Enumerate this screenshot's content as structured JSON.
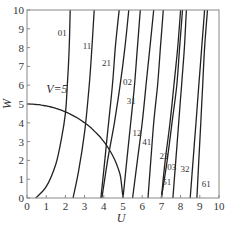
{
  "chart_data": {
    "type": "line",
    "title": "",
    "xlabel": "U",
    "ylabel": "W",
    "xlim": [
      0,
      10
    ],
    "ylim": [
      0,
      10
    ],
    "xticks": [
      "0",
      "1",
      "2",
      "3",
      "4",
      "5",
      "6",
      "7",
      "8",
      "9",
      "10"
    ],
    "yticks": [
      "0",
      "1",
      "2",
      "3",
      "4",
      "5",
      "6",
      "7",
      "8",
      "9",
      "10"
    ],
    "grid": false,
    "legend": null,
    "annotations": [
      {
        "text": "V=5",
        "x": 1.0,
        "y": 5.6
      }
    ],
    "series": [
      {
        "name": "V=5",
        "points": [
          [
            0,
            5
          ],
          [
            1,
            4.9
          ],
          [
            2,
            4.58
          ],
          [
            3,
            4.0
          ],
          [
            3.5,
            3.57
          ],
          [
            4,
            3.0
          ],
          [
            4.5,
            2.18
          ],
          [
            4.8,
            1.4
          ],
          [
            5,
            0
          ]
        ]
      },
      {
        "name": "01",
        "label_pos": [
          1.6,
          8.6
        ],
        "points": [
          [
            0.45,
            0
          ],
          [
            1.0,
            0.6
          ],
          [
            1.5,
            1.8
          ],
          [
            1.8,
            3.2
          ],
          [
            2.0,
            4.5
          ],
          [
            2.1,
            6
          ],
          [
            2.2,
            8
          ],
          [
            2.25,
            10
          ]
        ]
      },
      {
        "name": "11",
        "label_pos": [
          2.9,
          7.9
        ],
        "points": [
          [
            2.4,
            0
          ],
          [
            2.7,
            1.5
          ],
          [
            3.0,
            3.5
          ],
          [
            3.2,
            5.5
          ],
          [
            3.35,
            7.5
          ],
          [
            3.5,
            10
          ]
        ]
      },
      {
        "name": "21",
        "label_pos": [
          3.9,
          7.0
        ],
        "points": [
          [
            3.85,
            0
          ],
          [
            4.05,
            2
          ],
          [
            4.25,
            4
          ],
          [
            4.45,
            6
          ],
          [
            4.6,
            8
          ],
          [
            4.8,
            10
          ]
        ]
      },
      {
        "name": "02",
        "label_pos": [
          5.0,
          6.0
        ],
        "points": [
          [
            3.9,
            0
          ],
          [
            4.2,
            2
          ],
          [
            4.55,
            4
          ],
          [
            4.85,
            6
          ],
          [
            5.1,
            8
          ],
          [
            5.3,
            10
          ]
        ]
      },
      {
        "name": "31",
        "label_pos": [
          5.2,
          5.0
        ],
        "points": [
          [
            5.0,
            0
          ],
          [
            5.2,
            2
          ],
          [
            5.4,
            4
          ],
          [
            5.6,
            6
          ],
          [
            5.75,
            8
          ],
          [
            5.9,
            10
          ]
        ]
      },
      {
        "name": "12",
        "label_pos": [
          5.5,
          3.3
        ],
        "points": [
          [
            5.5,
            0
          ],
          [
            5.75,
            2
          ],
          [
            6.0,
            4
          ],
          [
            6.2,
            6
          ],
          [
            6.4,
            8
          ],
          [
            6.6,
            10
          ]
        ]
      },
      {
        "name": "41",
        "label_pos": [
          6.0,
          2.8
        ],
        "points": [
          [
            6.3,
            0
          ],
          [
            6.45,
            2
          ],
          [
            6.6,
            4
          ],
          [
            6.8,
            6
          ],
          [
            6.95,
            8
          ],
          [
            7.1,
            10
          ]
        ]
      },
      {
        "name": "22",
        "label_pos": [
          6.9,
          2.1
        ],
        "points": [
          [
            7.0,
            0
          ],
          [
            7.2,
            2
          ],
          [
            7.45,
            4
          ],
          [
            7.65,
            6
          ],
          [
            7.85,
            8
          ],
          [
            8.0,
            10
          ]
        ]
      },
      {
        "name": "03",
        "label_pos": [
          7.3,
          1.5
        ],
        "points": [
          [
            7.0,
            0
          ],
          [
            7.3,
            2
          ],
          [
            7.55,
            4
          ],
          [
            7.8,
            6
          ],
          [
            7.95,
            8
          ],
          [
            8.1,
            10
          ]
        ]
      },
      {
        "name": "51",
        "label_pos": [
          7.05,
          0.7
        ],
        "points": [
          [
            7.6,
            0
          ],
          [
            7.75,
            2
          ],
          [
            7.9,
            4
          ],
          [
            8.05,
            6
          ],
          [
            8.2,
            8
          ],
          [
            8.3,
            10
          ]
        ]
      },
      {
        "name": "32",
        "label_pos": [
          8.0,
          1.4
        ],
        "points": [
          [
            8.5,
            0
          ],
          [
            8.65,
            2
          ],
          [
            8.8,
            4
          ],
          [
            8.95,
            6
          ],
          [
            9.1,
            8
          ],
          [
            9.25,
            10
          ]
        ]
      },
      {
        "name": "61",
        "label_pos": [
          9.1,
          0.6
        ],
        "points": [
          [
            8.85,
            0
          ],
          [
            8.95,
            2
          ],
          [
            9.05,
            4
          ],
          [
            9.15,
            6
          ],
          [
            9.25,
            8
          ],
          [
            9.4,
            10
          ]
        ]
      }
    ]
  }
}
